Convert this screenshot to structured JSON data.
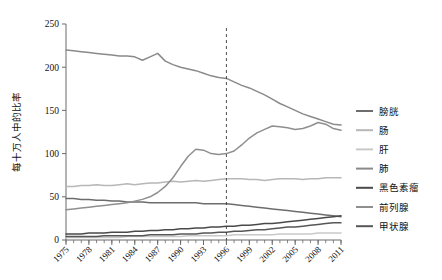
{
  "chart_data": {
    "type": "line",
    "title": "",
    "xlabel": "",
    "ylabel": "每十万人中的比率",
    "ylim": [
      0,
      250
    ],
    "xlim": [
      1975,
      2011
    ],
    "yticks": [
      0,
      50,
      100,
      150,
      200,
      250
    ],
    "ytick_labels": [
      "0",
      "50",
      "100",
      "150",
      "200",
      "250"
    ],
    "xticks": [
      1975,
      1978,
      1981,
      1984,
      1987,
      1990,
      1993,
      1996,
      1999,
      2002,
      2005,
      2008,
      2011
    ],
    "xtick_labels": [
      "1975",
      "1978",
      "1981",
      "1984",
      "1987",
      "1990",
      "1993",
      "1996",
      "1999",
      "2002",
      "2005",
      "2008",
      "2011"
    ],
    "minor_xtick_interval": 1,
    "grid": false,
    "legend_position": "right",
    "annotations": [
      {
        "type": "vertical-dashed-line",
        "x": 1996,
        "label": "1996"
      }
    ],
    "x": [
      1975,
      1976,
      1977,
      1978,
      1979,
      1980,
      1981,
      1982,
      1983,
      1984,
      1985,
      1986,
      1987,
      1988,
      1989,
      1990,
      1991,
      1992,
      1993,
      1994,
      1995,
      1996,
      1997,
      1998,
      1999,
      2000,
      2001,
      2002,
      2003,
      2004,
      2005,
      2006,
      2007,
      2008,
      2009,
      2010,
      2011
    ],
    "series": [
      {
        "name": "膀胱",
        "color": "#6d6d6d",
        "values": [
          48,
          48,
          47,
          47,
          46,
          46,
          45,
          45,
          44,
          44,
          44,
          43,
          43,
          43,
          43,
          43,
          43,
          43,
          42,
          42,
          42,
          42,
          41,
          40,
          39,
          38,
          37,
          36,
          35,
          34,
          33,
          32,
          31,
          30,
          29,
          28,
          27
        ]
      },
      {
        "name": "肠",
        "color": "#b7b7b7",
        "values": [
          62,
          62,
          63,
          63,
          64,
          63,
          63,
          64,
          65,
          64,
          65,
          66,
          66,
          67,
          68,
          67,
          68,
          69,
          68,
          69,
          70,
          71,
          71,
          71,
          70,
          70,
          69,
          70,
          71,
          71,
          71,
          70,
          71,
          71,
          72,
          72,
          72
        ]
      },
      {
        "name": "肝",
        "color": "#c9c9c9",
        "values": [
          3,
          3,
          3,
          3,
          3,
          3,
          3,
          3,
          4,
          4,
          4,
          4,
          4,
          4,
          4,
          4,
          5,
          5,
          5,
          5,
          5,
          5,
          6,
          6,
          6,
          6,
          6,
          6,
          7,
          7,
          7,
          7,
          7,
          8,
          8,
          8,
          8
        ]
      },
      {
        "name": "肺",
        "color": "#8a8a8a",
        "values": [
          220,
          219,
          218,
          217,
          216,
          215,
          214,
          213,
          213,
          212,
          208,
          212,
          216,
          207,
          203,
          200,
          198,
          196,
          193,
          190,
          188,
          187,
          183,
          179,
          176,
          172,
          168,
          163,
          158,
          154,
          150,
          146,
          143,
          140,
          137,
          134,
          133
        ]
      },
      {
        "name": "黑色素瘤",
        "color": "#4a4a4a",
        "values": [
          7,
          7,
          7,
          8,
          8,
          8,
          9,
          9,
          9,
          10,
          10,
          11,
          11,
          12,
          12,
          13,
          13,
          14,
          14,
          15,
          15,
          16,
          16,
          17,
          17,
          18,
          19,
          19,
          20,
          21,
          22,
          23,
          24,
          25,
          26,
          27,
          28
        ]
      },
      {
        "name": "前列腺",
        "color": "#8f8f8f",
        "values": [
          35,
          36,
          37,
          38,
          39,
          40,
          41,
          42,
          43,
          45,
          47,
          50,
          55,
          62,
          72,
          85,
          97,
          105,
          104,
          100,
          99,
          100,
          103,
          110,
          118,
          124,
          128,
          132,
          131,
          130,
          128,
          129,
          132,
          136,
          134,
          129,
          127
        ]
      },
      {
        "name": "甲状腺",
        "color": "#575757",
        "values": [
          4,
          4,
          4,
          4,
          4,
          5,
          5,
          5,
          5,
          5,
          5,
          6,
          6,
          6,
          6,
          7,
          7,
          7,
          8,
          8,
          9,
          9,
          10,
          10,
          11,
          12,
          12,
          13,
          14,
          15,
          15,
          16,
          17,
          18,
          19,
          20,
          20
        ]
      }
    ]
  },
  "legend": {
    "items": [
      {
        "label": "膀胱",
        "color": "#6d6d6d"
      },
      {
        "label": "肠",
        "color": "#b7b7b7"
      },
      {
        "label": "肝",
        "color": "#c9c9c9"
      },
      {
        "label": "肺",
        "color": "#8a8a8a"
      },
      {
        "label": "黑色素瘤",
        "color": "#4a4a4a"
      },
      {
        "label": "前列腺",
        "color": "#8f8f8f"
      },
      {
        "label": "甲状腺",
        "color": "#575757"
      }
    ]
  }
}
